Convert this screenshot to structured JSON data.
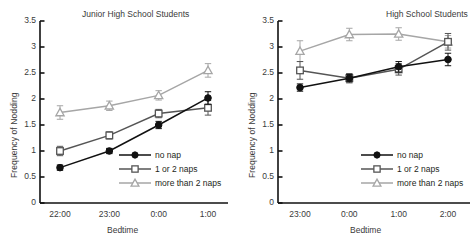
{
  "figure": {
    "background": "#ffffff",
    "series_colors": {
      "no_nap": "#111111",
      "one_or_two_naps": "#555555",
      "more_than_2_naps": "#a6a6a6"
    }
  },
  "chart_data": [
    {
      "type": "line",
      "panel": "left",
      "title": "Junior High School Students",
      "xlabel": "Bedtime",
      "ylabel": "Frequency of Nodding",
      "categories": [
        "22:00",
        "23:00",
        "0:00",
        "1:00"
      ],
      "ylim": [
        0,
        3.5
      ],
      "yticks": [
        "0",
        "0.5",
        "1",
        "1.5",
        "2",
        "2.5",
        "3",
        "3.5"
      ],
      "ytick_values": [
        0,
        0.5,
        1,
        1.5,
        2,
        2.5,
        3,
        3.5
      ],
      "grid": false,
      "legend_position": "lower-right-inside",
      "series": [
        {
          "name": "no nap",
          "marker": "filled-circle",
          "color": "#111111",
          "values": [
            0.68,
            1.0,
            1.5,
            2.02
          ],
          "errors": [
            0.05,
            0.05,
            0.07,
            0.12
          ]
        },
        {
          "name": "1 or 2 naps",
          "marker": "open-square",
          "color": "#555555",
          "values": [
            1.0,
            1.3,
            1.72,
            1.83
          ],
          "errors": [
            0.09,
            0.07,
            0.08,
            0.14
          ]
        },
        {
          "name": "more than 2 naps",
          "marker": "open-triangle",
          "color": "#a6a6a6",
          "values": [
            1.74,
            1.87,
            2.07,
            2.55
          ],
          "errors": [
            0.13,
            0.09,
            0.09,
            0.13
          ]
        }
      ]
    },
    {
      "type": "line",
      "panel": "right",
      "title": "High School Students",
      "xlabel": "Bedtime",
      "ylabel": "Frequency of Nodding",
      "categories": [
        "23:00",
        "0:00",
        "1:00",
        "2:00"
      ],
      "ylim": [
        0,
        3.5
      ],
      "yticks": [
        "0",
        "0.5",
        "1",
        "1.5",
        "2",
        "2.5",
        "3",
        "3.5"
      ],
      "ytick_values": [
        0,
        0.5,
        1,
        1.5,
        2,
        2.5,
        3,
        3.5
      ],
      "grid": false,
      "legend_position": "lower-right-inside",
      "series": [
        {
          "name": "no nap",
          "marker": "filled-circle",
          "color": "#111111",
          "values": [
            2.22,
            2.4,
            2.62,
            2.76
          ],
          "errors": [
            0.07,
            0.07,
            0.1,
            0.12
          ]
        },
        {
          "name": "1 or 2 naps",
          "marker": "open-square",
          "color": "#555555",
          "values": [
            2.55,
            2.4,
            2.57,
            3.1
          ],
          "errors": [
            0.17,
            0.09,
            0.11,
            0.16
          ]
        },
        {
          "name": "more than 2 naps",
          "marker": "open-triangle",
          "color": "#a6a6a6",
          "values": [
            2.92,
            3.24,
            3.25,
            3.1
          ],
          "errors": [
            0.2,
            0.12,
            0.12,
            0.12
          ]
        }
      ]
    }
  ],
  "legend": {
    "items": [
      {
        "label": "no nap",
        "marker": "filled-circle",
        "color": "#111111"
      },
      {
        "label": "1 or 2 naps",
        "marker": "open-square",
        "color": "#555555"
      },
      {
        "label": "more than 2 naps",
        "marker": "open-triangle",
        "color": "#a6a6a6"
      }
    ]
  }
}
